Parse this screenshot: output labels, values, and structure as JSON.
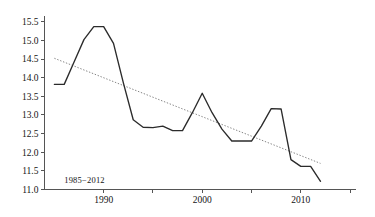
{
  "chart_data": {
    "type": "line",
    "title": "",
    "subtitle": "",
    "xlabel": "",
    "ylabel": "",
    "xlim": [
      1984.0,
      2015.6
    ],
    "ylim": [
      11.0,
      15.6
    ],
    "grid": false,
    "legend": "none",
    "annotations": [
      {
        "text": "1985−2012",
        "x": 1986.0,
        "y": 11.18
      }
    ],
    "y_ticks": [
      11.0,
      11.5,
      12.0,
      12.5,
      13.0,
      13.5,
      14.0,
      14.5,
      15.0,
      15.5
    ],
    "y_tick_labels": [
      "11.0",
      "11.5",
      "12.0",
      "12.5",
      "13.0",
      "13.5",
      "14.0",
      "14.5",
      "15.0",
      "15.5"
    ],
    "x_ticks": [
      1990,
      1995,
      2000,
      2005,
      2010,
      2015
    ],
    "x_tick_labels": [
      "1990",
      "",
      "2000",
      "",
      "2010",
      ""
    ],
    "x_major_labeled": [
      1990,
      2000,
      2010
    ],
    "series": [
      {
        "name": "observed",
        "style": "solid",
        "color": "#2b2b2b",
        "x": [
          1985,
          1986,
          1987,
          1988,
          1989,
          1990,
          1991,
          1992,
          1993,
          1994,
          1995,
          1996,
          1997,
          1998,
          1999,
          2000,
          2001,
          2002,
          2003,
          2004,
          2005,
          2006,
          2007,
          2008,
          2009,
          2010,
          2011,
          2012
        ],
        "values": [
          13.82,
          13.82,
          14.42,
          15.02,
          15.37,
          15.37,
          14.92,
          13.86,
          12.87,
          12.67,
          12.66,
          12.7,
          12.58,
          12.58,
          13.06,
          13.58,
          13.06,
          12.62,
          12.3,
          12.3,
          12.3,
          12.7,
          13.17,
          13.16,
          11.8,
          11.62,
          11.62,
          11.22
        ]
      },
      {
        "name": "trend",
        "style": "dotted",
        "color": "#777777",
        "x": [
          1985,
          2012
        ],
        "values": [
          14.52,
          11.7
        ]
      }
    ]
  },
  "axes": {
    "y_axis_name": "value-axis",
    "x_axis_name": "year-axis"
  }
}
